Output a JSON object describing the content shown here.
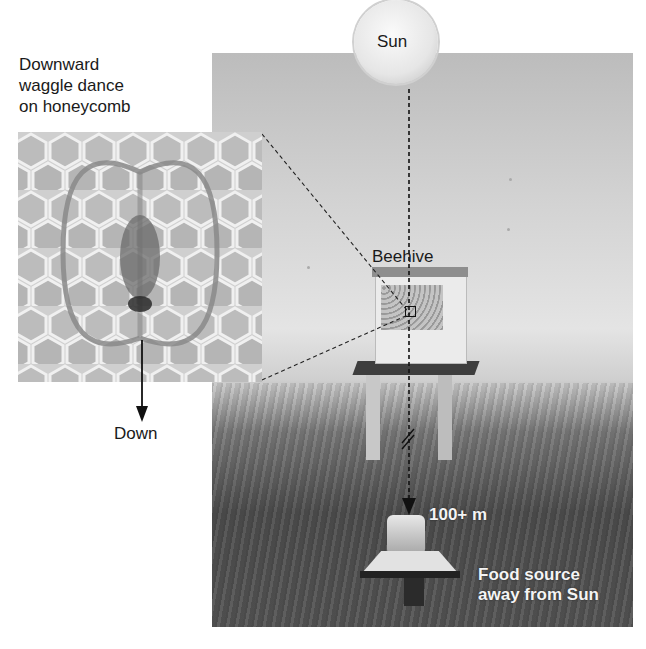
{
  "figure": {
    "labels": {
      "dance_caption_line1": "Downward",
      "dance_caption_line2": "waggle dance",
      "dance_caption_line3": "on honeycomb",
      "sun": "Sun",
      "beehive": "Beehive",
      "distance": "100+ m",
      "down": "Down",
      "food_line1": "Food source",
      "food_line2": "away from Sun"
    },
    "colors": {
      "sky": "#d8d8d8",
      "grass": "#555555",
      "dance_path": "#8a8a8a",
      "honeycomb": "#cfcfcf",
      "dashed_line": "#111111"
    }
  }
}
